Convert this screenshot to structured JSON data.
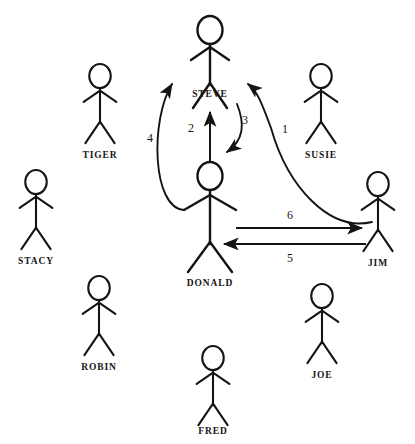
{
  "diagram": {
    "type": "stick-figure-network",
    "width": 415,
    "height": 444,
    "background_color": "#ffffff",
    "stroke_color": "#141414",
    "figures": [
      {
        "id": "steve",
        "label": "STEVE",
        "x": 210,
        "y": 30,
        "label_x": 210,
        "label_y": 97,
        "scale": 1.0
      },
      {
        "id": "tiger",
        "label": "TIGER",
        "x": 100,
        "y": 76,
        "label_x": 100,
        "label_y": 158,
        "scale": 0.86
      },
      {
        "id": "susie",
        "label": "SUSIE",
        "x": 321,
        "y": 76,
        "label_x": 321,
        "label_y": 158,
        "scale": 0.86
      },
      {
        "id": "stacy",
        "label": "STACY",
        "x": 36,
        "y": 182,
        "label_x": 36,
        "label_y": 264,
        "scale": 0.86
      },
      {
        "id": "donald",
        "label": "DONALD",
        "x": 210,
        "y": 176,
        "label_x": 210,
        "label_y": 286,
        "scale": 1.0
      },
      {
        "id": "jim",
        "label": "JIM",
        "x": 378,
        "y": 184,
        "label_x": 378,
        "label_y": 266,
        "scale": 0.86
      },
      {
        "id": "robin",
        "label": "ROBIN",
        "x": 99,
        "y": 288,
        "label_x": 99,
        "label_y": 370,
        "scale": 0.86
      },
      {
        "id": "joe",
        "label": "JOE",
        "x": 322,
        "y": 296,
        "label_x": 322,
        "label_y": 378,
        "scale": 0.86
      },
      {
        "id": "fred",
        "label": "FRED",
        "x": 213,
        "y": 358,
        "label_x": 213,
        "label_y": 434,
        "scale": 0.86
      }
    ],
    "edges": [
      {
        "id": "edge-1",
        "label": "1",
        "from": "jim",
        "to": "steve",
        "shape": "curve",
        "label_x": 285,
        "label_y": 133
      },
      {
        "id": "edge-2",
        "label": "2",
        "from": "donald",
        "to": "steve",
        "shape": "straight-vertical",
        "label_x": 191,
        "label_y": 132
      },
      {
        "id": "edge-3",
        "label": "3",
        "from": "steve",
        "to": "donald",
        "shape": "curve",
        "label_x": 243,
        "label_y": 124
      },
      {
        "id": "edge-4",
        "label": "4",
        "from": "donald",
        "to": "steve",
        "shape": "curve",
        "label_x": 150,
        "label_y": 142
      },
      {
        "id": "edge-5",
        "label": "5",
        "from": "jim",
        "to": "donald",
        "shape": "straight-horizontal",
        "label_x": 290,
        "label_y": 260
      },
      {
        "id": "edge-6",
        "label": "6",
        "from": "donald",
        "to": "jim",
        "shape": "straight-horizontal",
        "label_x": 290,
        "label_y": 218
      }
    ]
  }
}
